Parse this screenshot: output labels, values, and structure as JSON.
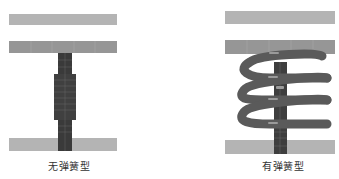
{
  "figures": [
    {
      "caption": "无弹簧型",
      "type": "without-spring"
    },
    {
      "caption": "有弹簧型",
      "type": "with-spring"
    }
  ],
  "colors": {
    "plate_light": "#b4b4b4",
    "plate_mid": "#969696",
    "column_dark": "#3a3a3a",
    "spring": "#5a5a5a",
    "spring_highlight": "#8a8a8a",
    "caption_text": "#333333"
  }
}
